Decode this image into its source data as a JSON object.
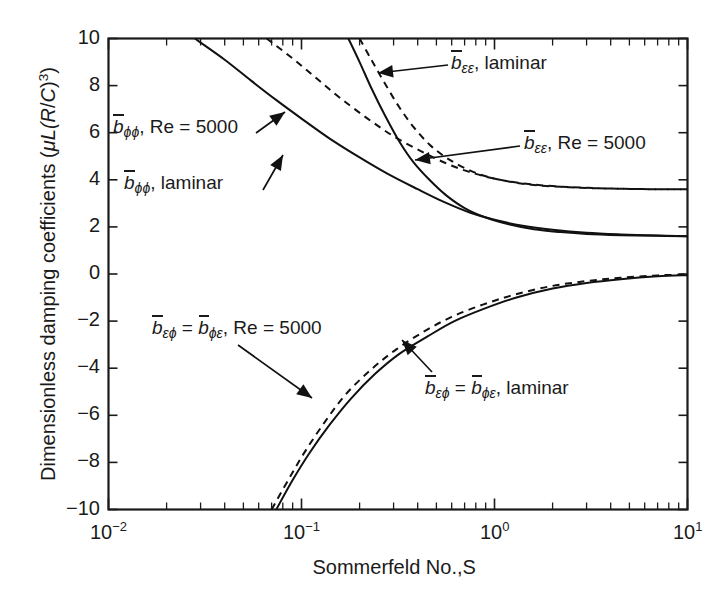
{
  "chart_data": {
    "type": "line",
    "title": "",
    "xlabel": "Sommerfeld No.,S",
    "ylabel": "Dimensionless damping coefficients (μL(R/C)³)",
    "xscale": "log",
    "yscale": "linear",
    "xlim": [
      0.01,
      10
    ],
    "ylim": [
      -10,
      10
    ],
    "grid": false,
    "legend_position": "inline-annotations",
    "xticks": [
      "10⁻²",
      "10⁻¹",
      "10⁰",
      "10¹"
    ],
    "xtick_values": [
      0.01,
      0.1,
      1,
      10
    ],
    "yticks": [
      "10",
      "8",
      "6",
      "4",
      "2",
      "0",
      "−2",
      "−4",
      "−6",
      "−8",
      "−10"
    ],
    "ytick_values": [
      10,
      8,
      6,
      4,
      2,
      0,
      -2,
      -4,
      -6,
      -8,
      -10
    ],
    "series": [
      {
        "name": "b_phiphi, laminar",
        "style": "solid",
        "x": [
          0.028,
          0.04,
          0.055,
          0.075,
          0.1,
          0.14,
          0.2,
          0.28,
          0.4,
          0.55,
          0.75,
          1.0,
          1.4,
          2.0,
          3.0,
          4.5,
          7.0,
          10.0
        ],
        "y": [
          10.0,
          9.1,
          8.2,
          7.35,
          6.6,
          5.75,
          4.95,
          4.25,
          3.6,
          3.05,
          2.6,
          2.3,
          2.05,
          1.88,
          1.75,
          1.68,
          1.63,
          1.6
        ]
      },
      {
        "name": "b_phiphi, Re = 5000",
        "style": "dashed",
        "x": [
          0.066,
          0.09,
          0.12,
          0.16,
          0.22,
          0.3,
          0.42,
          0.58,
          0.8,
          1.1,
          1.5,
          2.1,
          3.0,
          4.5,
          7.0,
          10.0
        ],
        "y": [
          10.0,
          9.15,
          8.3,
          7.45,
          6.6,
          5.85,
          5.2,
          4.65,
          4.25,
          3.98,
          3.82,
          3.72,
          3.66,
          3.62,
          3.6,
          3.6
        ]
      },
      {
        "name": "b_epsepsilon, laminar",
        "style": "solid",
        "x": [
          0.175,
          0.2,
          0.23,
          0.27,
          0.32,
          0.38,
          0.46,
          0.56,
          0.7,
          0.9,
          1.2,
          1.6,
          2.2,
          3.0,
          4.5,
          7.0,
          10.0
        ],
        "y": [
          10.0,
          9.0,
          7.9,
          6.75,
          5.65,
          4.75,
          4.0,
          3.35,
          2.8,
          2.4,
          2.1,
          1.9,
          1.78,
          1.7,
          1.65,
          1.62,
          1.6
        ]
      },
      {
        "name": "b_epsepsilon, Re = 5000",
        "style": "dashed",
        "x": [
          0.2,
          0.23,
          0.27,
          0.32,
          0.38,
          0.46,
          0.56,
          0.7,
          0.9,
          1.2,
          1.6,
          2.2,
          3.0,
          4.5,
          7.0,
          10.0
        ],
        "y": [
          10.0,
          9.1,
          8.1,
          7.1,
          6.25,
          5.5,
          4.95,
          4.5,
          4.15,
          3.92,
          3.78,
          3.7,
          3.65,
          3.62,
          3.6,
          3.6
        ]
      },
      {
        "name": "b_epsphi = b_phieps, laminar",
        "style": "solid",
        "x": [
          0.074,
          0.09,
          0.11,
          0.14,
          0.18,
          0.24,
          0.32,
          0.45,
          0.62,
          0.9,
          1.3,
          2.0,
          3.0,
          4.5,
          7.0,
          10.0
        ],
        "y": [
          -10.0,
          -8.75,
          -7.6,
          -6.4,
          -5.3,
          -4.25,
          -3.4,
          -2.65,
          -2.0,
          -1.45,
          -1.0,
          -0.62,
          -0.38,
          -0.22,
          -0.1,
          -0.05
        ]
      },
      {
        "name": "b_epsphi = b_phieps, Re = 5000",
        "style": "dashed",
        "x": [
          0.07,
          0.086,
          0.105,
          0.133,
          0.17,
          0.23,
          0.31,
          0.43,
          0.6,
          0.87,
          1.27,
          1.95,
          3.0,
          4.5,
          7.0,
          10.0
        ],
        "y": [
          -10.0,
          -8.7,
          -7.5,
          -6.25,
          -5.1,
          -4.05,
          -3.2,
          -2.45,
          -1.82,
          -1.3,
          -0.88,
          -0.52,
          -0.3,
          -0.16,
          -0.06,
          -0.02
        ]
      }
    ],
    "annotations": [
      {
        "id": "ann-bphiphi-re",
        "text": "b̅_ϕϕ, Re = 5000",
        "points_to_series": "b_phiphi, Re = 5000"
      },
      {
        "id": "ann-bphiphi-laminar",
        "text": "b̅_ϕϕ, laminar",
        "points_to_series": "b_phiphi, laminar"
      },
      {
        "id": "ann-beps-laminar",
        "text": "b̅_εε, laminar",
        "points_to_series": "b_epsepsilon, laminar"
      },
      {
        "id": "ann-beps-re",
        "text": "b̅_εε, Re = 5000",
        "points_to_series": "b_epsepsilon, Re = 5000"
      },
      {
        "id": "ann-bcross-re",
        "text": "b̅_εϕ = b̅_ϕε, Re = 5000",
        "points_to_series": "b_epsphi = b_phieps, Re = 5000"
      },
      {
        "id": "ann-bcross-laminar",
        "text": "b̅_εϕ = b̅_ϕε, laminar",
        "points_to_series": "b_epsphi = b_phieps, laminar"
      }
    ]
  },
  "axes": {
    "x_title": "Sommerfeld No.,S",
    "y_title_prefix": "Dimensionless damping coefficients (",
    "y_title_mu": "μ",
    "y_title_L": "L(",
    "y_title_R": "R",
    "y_title_slash": "/",
    "y_title_C": "C",
    "y_title_close": ")",
    "y_title_exp": "3",
    "y_title_end": ")",
    "ytick_labels": [
      "10",
      "8",
      "6",
      "4",
      "2",
      "0",
      "−2",
      "−4",
      "−6",
      "−8",
      "−10"
    ],
    "xtick_bases": [
      "10",
      "10",
      "10",
      "10"
    ],
    "xtick_exps": [
      "−2",
      "−1",
      "0",
      "1"
    ]
  },
  "labels": {
    "b_phiphi_re": {
      "b": "b",
      "sub": "ϕϕ",
      "rest": ", Re = 5000"
    },
    "b_phiphi_lam": {
      "b": "b",
      "sub": "ϕϕ",
      "rest": ", laminar"
    },
    "b_epseps_lam": {
      "b": "b",
      "sub": "εε",
      "rest": ", laminar"
    },
    "b_epseps_re": {
      "b": "b",
      "sub": "εε",
      "rest": ", Re = 5000"
    },
    "b_cross_re": {
      "b1": "b",
      "sub1": "εϕ",
      "eq": " = ",
      "b2": "b",
      "sub2": "ϕε",
      "rest": ", Re = 5000"
    },
    "b_cross_lam": {
      "b1": "b",
      "sub1": "εϕ",
      "eq": " = ",
      "b2": "b",
      "sub2": "ϕε",
      "rest": ", laminar"
    }
  },
  "colors": {
    "ink": "#1a1a1a",
    "background": "#ffffff"
  }
}
